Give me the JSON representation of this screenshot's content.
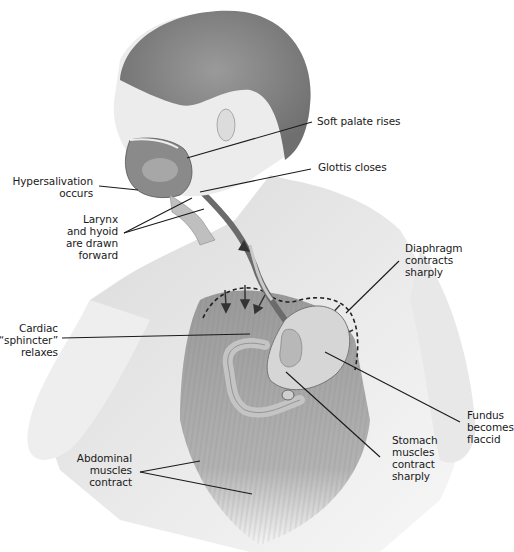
{
  "figure": {
    "colors": {
      "background": "#ffffff",
      "skin": "#e6e6e6",
      "hair": "#8a8a8a",
      "muscle": "#9a9a9a",
      "organ": "#cfcfcf",
      "leader_line": "#1a1a1a",
      "label_text": "#1a1a1a"
    }
  },
  "labels": {
    "soft_palate": "Soft palate rises",
    "glottis": "Glottis closes",
    "hypersalivation": "Hypersalivation\noccurs",
    "larynx": "Larynx\nand hyoid\nare drawn\nforward",
    "diaphragm": "Diaphragm\ncontracts\nsharply",
    "cardiac": "Cardiac\n“sphincter”\nrelaxes",
    "fundus": "Fundus\nbecomes\nflaccid",
    "stomach": "Stomach\nmuscles\ncontract\nsharply",
    "abdominal": "Abdominal\nmuscles\ncontract"
  }
}
